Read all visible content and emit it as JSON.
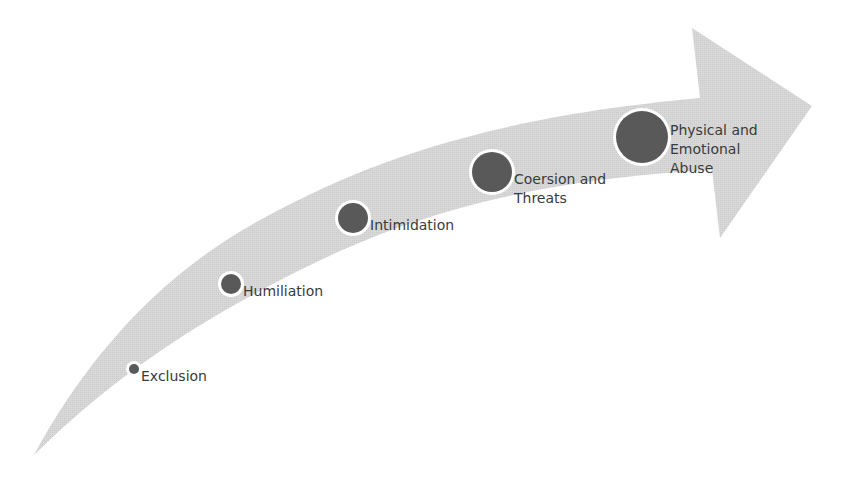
{
  "diagram": {
    "type": "escalation-arrow",
    "colors": {
      "arrow_fill": "#d6d6d6",
      "node_fill": "#595959",
      "node_ring": "#ffffff",
      "text": "#3a3a3a",
      "background": "#ffffff"
    },
    "stages": [
      {
        "label": "Exclusion",
        "cx": 134,
        "cy": 369,
        "r": 5
      },
      {
        "label": "Humiliation",
        "cx": 231,
        "cy": 284,
        "r": 10
      },
      {
        "label": "Intimidation",
        "cx": 353,
        "cy": 218,
        "r": 15
      },
      {
        "label": "Coersion and\nThreats",
        "cx": 492,
        "cy": 172,
        "r": 20
      },
      {
        "label": "Physical and\nEmotional\nAbuse",
        "cx": 642,
        "cy": 137,
        "r": 26
      }
    ]
  }
}
